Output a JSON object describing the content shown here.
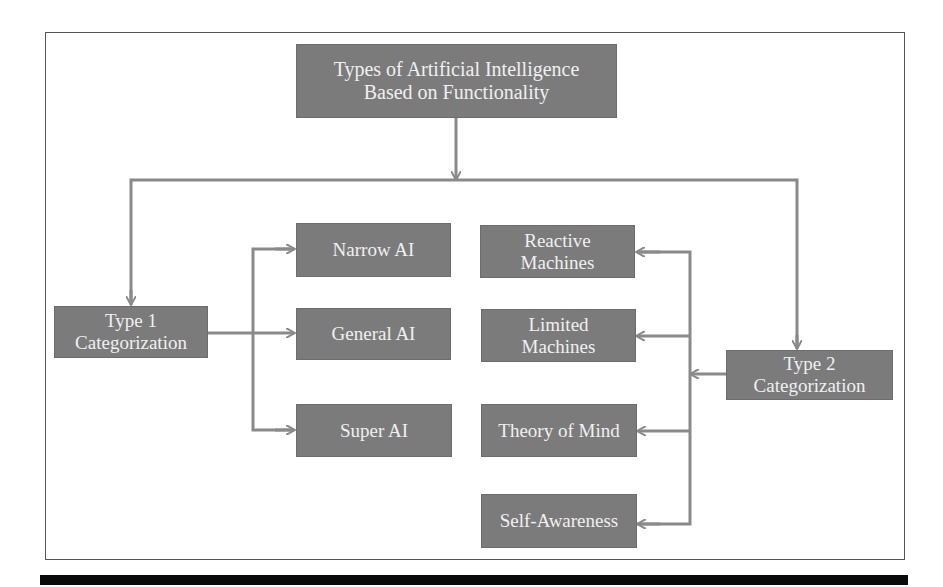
{
  "diagram": {
    "title": "Types of Artificial Intelligence\nBased on  Functionality",
    "type1": {
      "label": "Type 1\nCategorization",
      "children": [
        "Narrow AI",
        "General AI",
        "Super AI"
      ]
    },
    "type2": {
      "label": "Type 2\nCategorization",
      "children": [
        "Reactive\nMachines",
        "Limited\nMachines",
        "Theory of Mind",
        "Self-Awareness"
      ]
    },
    "colors": {
      "node_fill": "#7b7b7b",
      "node_text": "#f0f0f0",
      "connector": "#8a8a8a",
      "frame": "#555555",
      "bottom_bar": "#0a0a0a"
    }
  }
}
